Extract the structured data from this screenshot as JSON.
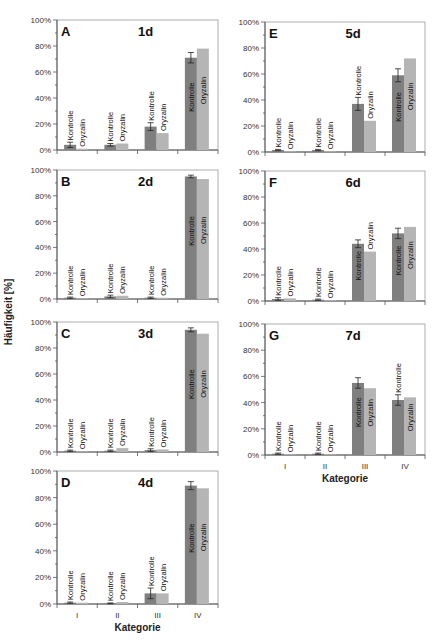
{
  "chart_data": {
    "type": "bar",
    "ylabel": "Häufigkeit [%]",
    "xlabel": "Kategorie",
    "categories": [
      "I",
      "II",
      "III",
      "IV"
    ],
    "series_names": [
      "Kontrolle",
      "Oryzalin"
    ],
    "ytick_labels": [
      "0%",
      "20%",
      "40%",
      "60%",
      "80%",
      "100%"
    ],
    "ylim": [
      0,
      100
    ],
    "colors": {
      "Kontrolle": "#7f7f7f",
      "Oryzalin": "#b5b5b5"
    },
    "panels": [
      {
        "letter": "A",
        "title": "1d",
        "series": [
          {
            "name": "Kontrolle",
            "values": [
              4,
              4,
              18,
              71
            ],
            "errors": [
              2,
              1,
              3,
              4
            ]
          },
          {
            "name": "Oryzalin",
            "values": [
              1,
              5,
              13,
              78
            ]
          }
        ]
      },
      {
        "letter": "B",
        "title": "2d",
        "series": [
          {
            "name": "Kontrolle",
            "values": [
              1,
              2,
              1,
              95
            ],
            "errors": [
              0.5,
              1,
              0.5,
              1
            ]
          },
          {
            "name": "Oryzalin",
            "values": [
              0.5,
              2.5,
              1,
              93
            ]
          }
        ]
      },
      {
        "letter": "C",
        "title": "3d",
        "series": [
          {
            "name": "Kontrolle",
            "values": [
              1,
              1,
              1.5,
              94
            ],
            "errors": [
              0.5,
              0.5,
              1,
              1.5
            ]
          },
          {
            "name": "Oryzalin",
            "values": [
              0.5,
              3,
              2,
              91
            ]
          }
        ]
      },
      {
        "letter": "D",
        "title": "4d",
        "series": [
          {
            "name": "Kontrolle",
            "values": [
              1,
              0.5,
              8,
              89
            ],
            "errors": [
              0.5,
              0.3,
              4,
              3
            ]
          },
          {
            "name": "Oryzalin",
            "values": [
              1,
              1.5,
              8,
              87
            ]
          }
        ]
      },
      {
        "letter": "E",
        "title": "5d",
        "series": [
          {
            "name": "Kontrolle",
            "values": [
              1.5,
              1.5,
              37,
              59
            ],
            "errors": [
              0.5,
              0.5,
              5,
              5
            ]
          },
          {
            "name": "Oryzalin",
            "values": [
              0.5,
              0.5,
              24,
              72
            ]
          }
        ]
      },
      {
        "letter": "F",
        "title": "6d",
        "series": [
          {
            "name": "Kontrolle",
            "values": [
              1.5,
              1,
              44,
              52
            ],
            "errors": [
              1,
              0.5,
              3,
              4
            ]
          },
          {
            "name": "Oryzalin",
            "values": [
              2,
              0.5,
              38,
              57
            ]
          }
        ]
      },
      {
        "letter": "G",
        "title": "7d",
        "series": [
          {
            "name": "Kontrolle",
            "values": [
              1,
              1,
              55,
              42
            ],
            "errors": [
              0.5,
              0.5,
              4,
              4
            ]
          },
          {
            "name": "Oryzalin",
            "values": [
              0.5,
              0.5,
              51,
              44
            ]
          }
        ]
      }
    ]
  }
}
